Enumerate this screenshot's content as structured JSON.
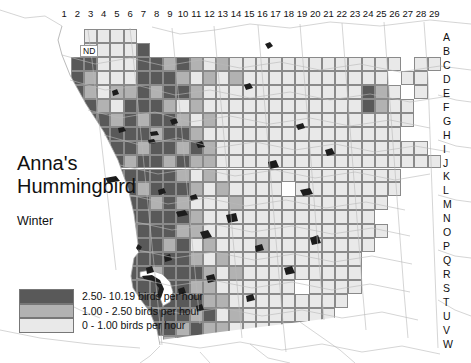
{
  "map": {
    "title": "Anna's Hummingbird",
    "title_lines": [
      "Anna's",
      "Hummingbird"
    ],
    "season": "Winter",
    "no_data_label": "ND",
    "column_labels": [
      "1",
      "2",
      "3",
      "4",
      "5",
      "6",
      "7",
      "8",
      "9",
      "10",
      "11",
      "12",
      "13",
      "14",
      "15",
      "16",
      "17",
      "18",
      "19",
      "20",
      "21",
      "22",
      "23",
      "24",
      "25",
      "26",
      "27",
      "28",
      "29"
    ],
    "row_labels": [
      "A",
      "B",
      "C",
      "D",
      "E",
      "F",
      "G",
      "H",
      "I",
      "J",
      "K",
      "L",
      "M",
      "N",
      "O",
      "P",
      "Q",
      "R",
      "S",
      "T",
      "U",
      "V",
      "W"
    ],
    "colors": {
      "high": "#595959",
      "medium": "#b2b2b2",
      "low": "#e9e9e9",
      "none": "#ffffff",
      "grid_line": "#8a8a8a",
      "coast_line": "#aaaaaa",
      "road_line": "#b9b9b9",
      "water_fill": "#1a1a1a",
      "background": "#ffffff",
      "text": "#111111"
    }
  },
  "legend": {
    "items": [
      {
        "swatch": "high",
        "label": "2.50- 10.19 birds per hour",
        "min": 2.5,
        "max": 10.19
      },
      {
        "swatch": "medium",
        "label": "1.00 - 2.50 birds per hour",
        "min": 1.0,
        "max": 2.5
      },
      {
        "swatch": "low",
        "label": "0 - 1.00 birds per hour",
        "min": 0.0,
        "max": 1.0
      }
    ]
  },
  "chart_data": {
    "type": "heatmap",
    "title": "Anna's Hummingbird",
    "subtitle": "Winter",
    "xlabel": "",
    "ylabel": "",
    "unit": "birds per hour",
    "x": [
      "1",
      "2",
      "3",
      "4",
      "5",
      "6",
      "7",
      "8",
      "9",
      "10",
      "11",
      "12",
      "13",
      "14",
      "15",
      "16",
      "17",
      "18",
      "19",
      "20",
      "21",
      "22",
      "23",
      "24",
      "25",
      "26",
      "27",
      "28",
      "29"
    ],
    "y": [
      "A",
      "B",
      "C",
      "D",
      "E",
      "F",
      "G",
      "H",
      "I",
      "J",
      "K",
      "L",
      "M",
      "N",
      "O",
      "P",
      "Q",
      "R",
      "S",
      "T",
      "U",
      "V",
      "W"
    ],
    "value_classes": {
      "0": "none",
      "1": "low",
      "2": "medium",
      "3": "high"
    },
    "class_ranges": {
      "low": [
        0,
        1.0
      ],
      "medium": [
        1.0,
        2.5
      ],
      "high": [
        2.5,
        10.19
      ]
    },
    "legend_position": "bottom-left",
    "grid": true,
    "cells": [
      [
        0,
        0,
        1,
        1,
        1,
        1,
        0,
        0,
        0,
        0,
        0,
        0,
        0,
        0,
        0,
        0,
        0,
        0,
        0,
        0,
        0,
        0,
        0,
        0,
        0,
        0,
        0,
        0,
        0
      ],
      [
        0,
        0,
        1,
        1,
        1,
        1,
        3,
        0,
        0,
        0,
        0,
        0,
        0,
        0,
        0,
        0,
        0,
        0,
        0,
        0,
        0,
        0,
        0,
        0,
        0,
        0,
        0,
        0,
        0
      ],
      [
        0,
        3,
        3,
        1,
        1,
        1,
        3,
        3,
        2,
        3,
        2,
        1,
        2,
        1,
        1,
        1,
        1,
        1,
        1,
        1,
        1,
        1,
        1,
        1,
        1,
        1,
        0,
        1,
        1
      ],
      [
        0,
        3,
        2,
        1,
        1,
        1,
        3,
        3,
        3,
        2,
        1,
        2,
        1,
        2,
        1,
        1,
        1,
        1,
        1,
        1,
        1,
        1,
        1,
        1,
        1,
        0,
        1,
        1,
        0
      ],
      [
        0,
        3,
        2,
        1,
        2,
        2,
        3,
        2,
        3,
        3,
        2,
        1,
        1,
        1,
        1,
        1,
        1,
        1,
        1,
        1,
        1,
        1,
        1,
        3,
        2,
        1,
        0,
        1,
        0
      ],
      [
        0,
        0,
        3,
        2,
        1,
        3,
        3,
        3,
        2,
        1,
        2,
        1,
        1,
        1,
        1,
        1,
        1,
        1,
        1,
        1,
        1,
        1,
        1,
        3,
        2,
        1,
        1,
        0,
        0
      ],
      [
        0,
        0,
        3,
        3,
        2,
        3,
        2,
        3,
        3,
        2,
        1,
        2,
        1,
        1,
        1,
        1,
        1,
        1,
        1,
        1,
        1,
        1,
        1,
        1,
        1,
        1,
        1,
        0,
        0
      ],
      [
        0,
        0,
        3,
        3,
        3,
        3,
        3,
        2,
        3,
        3,
        2,
        1,
        1,
        1,
        1,
        1,
        1,
        1,
        1,
        1,
        1,
        1,
        1,
        1,
        1,
        1,
        0,
        0,
        0
      ],
      [
        0,
        0,
        3,
        3,
        3,
        3,
        2,
        3,
        3,
        2,
        3,
        2,
        1,
        1,
        1,
        1,
        1,
        1,
        1,
        1,
        1,
        1,
        1,
        1,
        1,
        1,
        1,
        1,
        0
      ],
      [
        0,
        0,
        3,
        3,
        3,
        2,
        3,
        3,
        2,
        3,
        2,
        2,
        1,
        1,
        1,
        1,
        1,
        1,
        1,
        1,
        1,
        1,
        1,
        1,
        1,
        1,
        1,
        1,
        1
      ],
      [
        0,
        0,
        0,
        3,
        3,
        3,
        3,
        3,
        3,
        2,
        1,
        2,
        1,
        1,
        1,
        1,
        1,
        1,
        1,
        1,
        1,
        1,
        1,
        1,
        1,
        1,
        0,
        0,
        0
      ],
      [
        0,
        0,
        0,
        3,
        3,
        3,
        2,
        3,
        3,
        3,
        2,
        1,
        2,
        1,
        1,
        1,
        1,
        0,
        1,
        1,
        1,
        1,
        1,
        1,
        1,
        1,
        0,
        0,
        0
      ],
      [
        0,
        0,
        0,
        3,
        3,
        3,
        3,
        2,
        3,
        2,
        1,
        1,
        1,
        2,
        1,
        1,
        1,
        1,
        1,
        1,
        1,
        1,
        1,
        1,
        1,
        0,
        0,
        0,
        0
      ],
      [
        0,
        0,
        0,
        0,
        3,
        3,
        3,
        3,
        3,
        3,
        2,
        1,
        1,
        1,
        1,
        1,
        1,
        1,
        1,
        1,
        1,
        1,
        1,
        1,
        0,
        0,
        0,
        0,
        0
      ],
      [
        0,
        0,
        0,
        0,
        3,
        3,
        3,
        3,
        3,
        2,
        2,
        1,
        1,
        1,
        1,
        1,
        1,
        1,
        1,
        1,
        1,
        1,
        1,
        1,
        1,
        0,
        0,
        0,
        0
      ],
      [
        0,
        0,
        0,
        0,
        3,
        3,
        3,
        3,
        2,
        3,
        1,
        2,
        1,
        1,
        1,
        2,
        1,
        1,
        1,
        1,
        1,
        1,
        1,
        1,
        0,
        0,
        0,
        0,
        0
      ],
      [
        0,
        0,
        0,
        0,
        3,
        3,
        3,
        3,
        3,
        3,
        2,
        1,
        2,
        1,
        1,
        1,
        1,
        1,
        1,
        1,
        1,
        1,
        1,
        0,
        0,
        0,
        0,
        0,
        0
      ],
      [
        0,
        0,
        0,
        0,
        0,
        3,
        3,
        2,
        3,
        3,
        3,
        2,
        1,
        2,
        1,
        1,
        1,
        1,
        1,
        1,
        1,
        1,
        1,
        0,
        0,
        0,
        0,
        0,
        0
      ],
      [
        0,
        0,
        0,
        0,
        0,
        3,
        3,
        3,
        3,
        3,
        2,
        2,
        1,
        1,
        1,
        1,
        1,
        1,
        0,
        1,
        1,
        1,
        1,
        0,
        0,
        0,
        0,
        0,
        0
      ],
      [
        0,
        0,
        0,
        0,
        0,
        0,
        3,
        3,
        3,
        3,
        3,
        2,
        2,
        1,
        1,
        1,
        1,
        1,
        1,
        1,
        1,
        1,
        0,
        0,
        0,
        0,
        0,
        0,
        0
      ],
      [
        0,
        0,
        0,
        0,
        0,
        0,
        2,
        3,
        3,
        3,
        2,
        3,
        1,
        2,
        1,
        1,
        1,
        1,
        1,
        1,
        1,
        0,
        0,
        0,
        0,
        0,
        0,
        0,
        0
      ],
      [
        0,
        0,
        0,
        0,
        0,
        0,
        0,
        3,
        3,
        2,
        3,
        2,
        2,
        1,
        1,
        1,
        1,
        1,
        1,
        1,
        0,
        0,
        0,
        0,
        0,
        0,
        0,
        0,
        0
      ],
      [
        0,
        0,
        0,
        0,
        0,
        0,
        0,
        0,
        2,
        3,
        2,
        1,
        1,
        1,
        1,
        1,
        1,
        0,
        0,
        0,
        0,
        0,
        0,
        0,
        0,
        0,
        0,
        0,
        0
      ]
    ]
  }
}
